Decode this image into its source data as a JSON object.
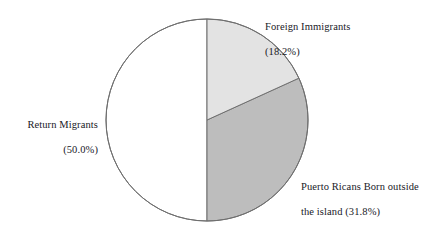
{
  "chart_data": {
    "type": "pie",
    "title": "",
    "subtitle": "",
    "xlabel": "",
    "ylabel": "",
    "legend_position": "none",
    "grid": false,
    "start_angle_deg": 0,
    "direction": "clockwise",
    "units": "percent",
    "categories": [
      "Foreign Immigrants",
      "Puerto Ricans Born outside the island",
      "Return Migrants"
    ],
    "values": [
      18.2,
      31.8,
      50.0
    ],
    "colors": [
      "#e3e3e3",
      "#bdbdbd",
      "#ffffff"
    ],
    "outline_color": "#6f6f6f",
    "slices": [
      {
        "name": "Foreign Immigrants",
        "value": 18.2,
        "value_label": "(18.2%)",
        "color": "#e3e3e3",
        "start_deg": 0,
        "end_deg": 65.52
      },
      {
        "name": "Puerto Ricans Born outside the island",
        "value": 31.8,
        "value_label": "(31.8%)",
        "color": "#bdbdbd",
        "start_deg": 65.52,
        "end_deg": 180.0
      },
      {
        "name": "Return Migrants",
        "value": 50.0,
        "value_label": "(50.0%)",
        "color": "#ffffff",
        "start_deg": 180.0,
        "end_deg": 360.0
      }
    ]
  },
  "labels": {
    "foreign_immigrants": {
      "line1": "Foreign Immigrants",
      "line2": "(18.2%)"
    },
    "return_migrants": {
      "line1": "Return Migrants",
      "line2": "(50.0%)"
    },
    "puerto_ricans": {
      "line1": "Puerto Ricans Born outside",
      "line2": "the island (31.8%)"
    }
  }
}
